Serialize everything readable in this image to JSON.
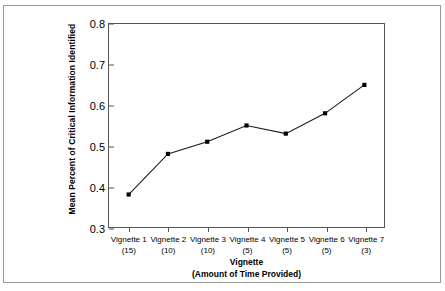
{
  "chart_data": {
    "type": "line",
    "title": "",
    "xlabel": "Vignette",
    "xlabel_sub": "(Amount of Time Provided)",
    "ylabel": "Mean Percent of Critical Information Identified",
    "categories": [
      "Vignette 1",
      "Vignette 2",
      "Vignette 3",
      "Vignette 4",
      "Vignette 5",
      "Vignette 6",
      "Vignette 7"
    ],
    "category_sublabels": [
      "(15)",
      "(10)",
      "(10)",
      "(5)",
      "(5)",
      "(5)",
      "(3)"
    ],
    "time_provided": [
      15,
      10,
      10,
      5,
      5,
      5,
      3
    ],
    "values": [
      0.38,
      0.48,
      0.51,
      0.55,
      0.53,
      0.58,
      0.65
    ],
    "ylim": [
      0.3,
      0.8
    ],
    "ytick_labels": [
      "0.8",
      "0.7",
      "0.6",
      "0.5",
      "0.4",
      "0.3"
    ],
    "ytick_values": [
      0.8,
      0.7,
      0.6,
      0.5,
      0.4,
      0.3
    ],
    "grid": false,
    "legend": "none",
    "line_color": "#1a1a1a",
    "marker_color": "#000000",
    "frame_color": "#555555",
    "border_color": "#9a9a9a",
    "background": "#ffffff"
  }
}
